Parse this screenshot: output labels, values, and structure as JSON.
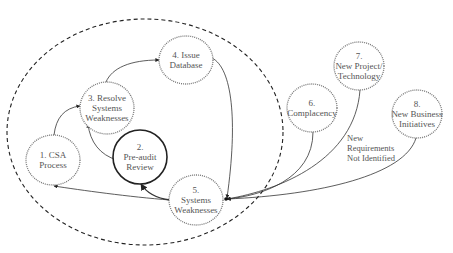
{
  "diagram": {
    "boundary": {
      "style": "dashed",
      "cx": 145,
      "cy": 132,
      "rx": 138,
      "ry": 113
    },
    "nodes": [
      {
        "id": "n1",
        "lines": [
          "1. CSA",
          "Process"
        ],
        "cx": 53,
        "cy": 160,
        "rx": 27,
        "ry": 25,
        "style": "dotted"
      },
      {
        "id": "n2",
        "lines": [
          "2.",
          "Pre-audit",
          "Review"
        ],
        "cx": 140,
        "cy": 157,
        "rx": 27,
        "ry": 27,
        "style": "solid"
      },
      {
        "id": "n3",
        "lines": [
          "3. Resolve",
          "Systems",
          "Weaknesses"
        ],
        "cx": 107,
        "cy": 108,
        "rx": 27,
        "ry": 26,
        "style": "dotted"
      },
      {
        "id": "n4",
        "lines": [
          "4. Issue",
          "Database"
        ],
        "cx": 186,
        "cy": 60,
        "rx": 27,
        "ry": 24,
        "style": "dotted"
      },
      {
        "id": "n5",
        "lines": [
          "5.",
          "Systems",
          "Weaknesses"
        ],
        "cx": 196,
        "cy": 200,
        "rx": 27,
        "ry": 25,
        "style": "dotted"
      },
      {
        "id": "n6",
        "lines": [
          "6.",
          "Complacency"
        ],
        "cx": 312,
        "cy": 108,
        "rx": 25,
        "ry": 24,
        "style": "dotted"
      },
      {
        "id": "n7",
        "lines": [
          "7.",
          "New Project/",
          "Technology"
        ],
        "cx": 359,
        "cy": 66,
        "rx": 25,
        "ry": 24,
        "style": "dotted"
      },
      {
        "id": "n8",
        "lines": [
          "8.",
          "New Business",
          "Initiatives"
        ],
        "cx": 417,
        "cy": 114,
        "rx": 25,
        "ry": 24,
        "style": "dotted"
      }
    ],
    "edges": [
      {
        "from": "n1",
        "to": "n3",
        "path": "M54,135 C56,118 64,108 80,106"
      },
      {
        "from": "n3",
        "to": "n4",
        "path": "M106,82 C112,68 130,60 159,60"
      },
      {
        "from": "n4",
        "to": "n5",
        "path": "M212,58 C232,68 238,120 227,198"
      },
      {
        "from": "n2",
        "to": "n3",
        "path": "M117,160 C100,155 90,142 88,124"
      },
      {
        "from": "n5",
        "to": "n2",
        "path": "M170,200 C155,198 146,192 141,184"
      },
      {
        "from": "n5",
        "to": "n1",
        "path": "M170,200 C130,197 80,190 54,186"
      },
      {
        "from": "n6",
        "to": "n5",
        "path": "M313,132 C313,180 260,196 227,199"
      },
      {
        "from": "n7",
        "to": "n5",
        "path": "M360,90 C355,160 280,190 227,199"
      },
      {
        "from": "n8",
        "to": "n5",
        "path": "M416,138 C405,175 320,195 227,199"
      }
    ],
    "edge_labels": [
      {
        "lines": [
          "New",
          "Requirements",
          "Not Identified"
        ],
        "x": 347,
        "y": 133
      }
    ],
    "colors": {
      "node_stroke": "#777777",
      "node_stroke_strong": "#222222",
      "edge": "#333333",
      "text": "#555555",
      "boundary": "#222222"
    }
  }
}
